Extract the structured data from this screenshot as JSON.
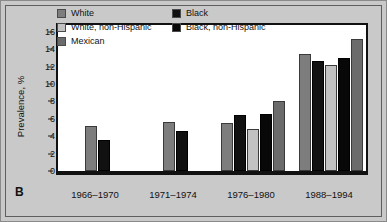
{
  "panel": {
    "letter": "B"
  },
  "chart_data": {
    "type": "bar",
    "title": "",
    "xlabel": "",
    "ylabel": "Prevalence, %",
    "ylim": [
      0,
      17
    ],
    "yticks": [
      0,
      2,
      4,
      6,
      8,
      10,
      12,
      14,
      16
    ],
    "grid": false,
    "legend_position": "top-left",
    "categories": [
      "1966–1970",
      "1971–1974",
      "1976–1980",
      "1988–1994"
    ],
    "series": [
      {
        "name": "White",
        "color": "#7d7d7d",
        "values": [
          5.2,
          5.6,
          5.5,
          13.4
        ]
      },
      {
        "name": "Black",
        "color": "#111111",
        "values": [
          3.6,
          4.6,
          6.4,
          12.6
        ]
      },
      {
        "name": "White, non-Hispanic",
        "color": "#c2c2c2",
        "values": [
          null,
          null,
          4.8,
          12.2
        ]
      },
      {
        "name": "Black, non-Hispanic",
        "color": "#080808",
        "values": [
          null,
          null,
          6.5,
          13.0
        ]
      },
      {
        "name": "Mexican",
        "color": "#6b6b6b",
        "values": [
          null,
          null,
          8.0,
          15.2
        ]
      }
    ],
    "legend": [
      {
        "label": "White",
        "color": "#7d7d7d"
      },
      {
        "label": "White, non-Hispanic",
        "color": "#c2c2c2"
      },
      {
        "label": "Mexican",
        "color": "#6b6b6b"
      },
      {
        "label": "Black",
        "color": "#111111"
      },
      {
        "label": "Black, non-Hispanic",
        "color": "#080808"
      }
    ]
  }
}
